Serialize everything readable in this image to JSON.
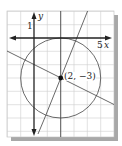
{
  "figure": {
    "type": "coordinate-graph",
    "axis_labels": {
      "x": "x",
      "y": "y"
    },
    "tick_labels": {
      "y_one": "1",
      "x_five": "5"
    },
    "center_label": "(2, −3)",
    "center": {
      "x": 2,
      "y": -3
    },
    "circle": {
      "center_x": 2,
      "center_y": -3,
      "radius": 3
    },
    "lines": [
      {
        "name": "steep-line",
        "through": [
          [
            2,
            -3
          ]
        ],
        "slope": 2.5
      },
      {
        "name": "shallow-line",
        "through": [
          [
            2,
            -3
          ]
        ],
        "slope": -0.5
      }
    ],
    "colors": {
      "grid": "#c8c8c8",
      "axes": "#222222",
      "shadow": "#a0a0a0",
      "curves": "#444444"
    }
  }
}
